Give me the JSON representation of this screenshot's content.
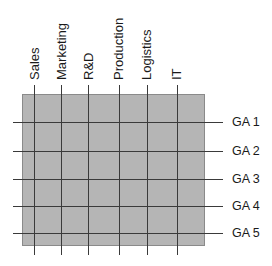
{
  "diagram": {
    "type": "matrix-organization-grid",
    "colors": {
      "box_fill": "#b5b5b5",
      "box_border": "#8a8a8a",
      "lines": "#3a3a3a",
      "text": "#1a1a1a"
    },
    "columns": [
      {
        "label": "Sales",
        "x": 34
      },
      {
        "label": "Marketing",
        "x": 61
      },
      {
        "label": "R&D",
        "x": 88
      },
      {
        "label": "Production",
        "x": 119
      },
      {
        "label": "Logistics",
        "x": 147
      },
      {
        "label": "IT",
        "x": 177
      }
    ],
    "rows": [
      {
        "label": "GA 1",
        "y": 122
      },
      {
        "label": "GA 2",
        "y": 151
      },
      {
        "label": "GA 3",
        "y": 179
      },
      {
        "label": "GA 4",
        "y": 206
      },
      {
        "label": "GA 5",
        "y": 233
      }
    ]
  }
}
